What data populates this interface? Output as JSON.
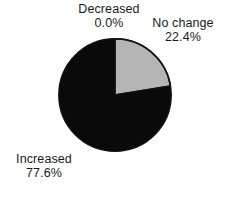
{
  "chart_data": {
    "type": "pie",
    "title": "",
    "subtitle": "",
    "xlabel": "",
    "ylabel": "",
    "legend_position": "none",
    "grid": false,
    "labels_outside": true,
    "start_angle_deg": 0,
    "direction": "clockwise",
    "categories": [
      "Decreased",
      "No change",
      "Increased"
    ],
    "values": [
      0.0,
      22.4,
      77.6
    ],
    "value_suffix": "%",
    "slices": [
      {
        "label": "Decreased",
        "value": 0.0,
        "value_text": "0.0%",
        "color": "#ffffff",
        "angle_deg": 0.0,
        "visible": false
      },
      {
        "label": "No change",
        "value": 22.4,
        "value_text": "22.4%",
        "color": "#b5b5b5",
        "angle_deg": 80.64,
        "visible": true
      },
      {
        "label": "Increased",
        "value": 77.6,
        "value_text": "77.6%",
        "color": "#0a0a0a",
        "angle_deg": 279.36,
        "visible": true
      }
    ],
    "outline_color": "#111111",
    "background_color": "#ffffff",
    "text_color": "#1a1a1a"
  },
  "labels": {
    "decreased": {
      "name": "Decreased",
      "value": "0.0%"
    },
    "no_change": {
      "name": "No change",
      "value": "22.4%"
    },
    "increased": {
      "name": "Increased",
      "value": "77.6%"
    }
  }
}
